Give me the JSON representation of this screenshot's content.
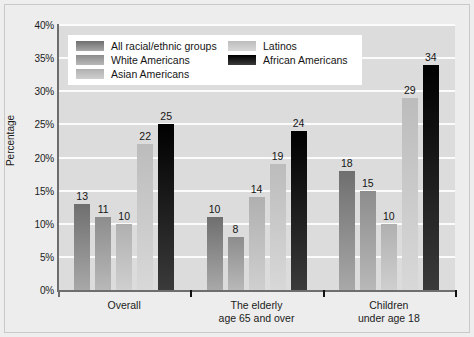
{
  "chart_data": {
    "type": "bar",
    "title": "",
    "subtitle": "",
    "xlabel": "",
    "ylabel": "Percentage",
    "ylim": [
      0,
      40
    ],
    "ytick_labels": [
      "0%",
      "5%",
      "10%",
      "15%",
      "20%",
      "25%",
      "30%",
      "35%",
      "40%"
    ],
    "ytick_values": [
      0,
      5,
      10,
      15,
      20,
      25,
      30,
      35,
      40
    ],
    "grid": true,
    "legend_position": "top-left-inside",
    "categories": [
      "Overall",
      "The elderly\nage 65 and over",
      "Children\nunder age 18"
    ],
    "series": [
      {
        "name": "All racial/ethnic groups",
        "color": "#8a8a8a",
        "color_top": "#6f6f6f",
        "color_bottom": "#a8a8a8",
        "values": [
          13,
          11,
          18
        ]
      },
      {
        "name": "White Americans",
        "color": "#9f9f9f",
        "color_top": "#8d8d8d",
        "color_bottom": "#b8b8b8",
        "values": [
          11,
          8,
          15
        ]
      },
      {
        "name": "Asian Americans",
        "color": "#bfbfbf",
        "color_top": "#b0b0b0",
        "color_bottom": "#cfcfcf",
        "values": [
          10,
          14,
          10
        ]
      },
      {
        "name": "Latinos",
        "color": "#c9c9c9",
        "color_top": "#bcbcbc",
        "color_bottom": "#d8d8d8",
        "values": [
          22,
          19,
          29
        ]
      },
      {
        "name": "African Americans",
        "color": "#141414",
        "color_top": "#000000",
        "color_bottom": "#3a3a3a",
        "values": [
          25,
          24,
          34
        ]
      }
    ],
    "bar_value_labels": [
      [
        "13",
        "11",
        "10",
        "22",
        "25"
      ],
      [
        "10",
        "8",
        "14",
        "19",
        "24"
      ],
      [
        "18",
        "15",
        "10",
        "29",
        "34"
      ]
    ]
  },
  "legend": {
    "entries": [
      {
        "label": "All racial/ethnic groups"
      },
      {
        "label": "White Americans"
      },
      {
        "label": "Asian Americans"
      },
      {
        "label": "Latinos"
      },
      {
        "label": "African Americans"
      }
    ]
  },
  "axis": {
    "y_title": "Percentage"
  },
  "group_labels": [
    {
      "line1": "Overall",
      "line2": ""
    },
    {
      "line1": "The elderly",
      "line2": "age 65 and over"
    },
    {
      "line1": "Children",
      "line2": "under age 18"
    }
  ]
}
